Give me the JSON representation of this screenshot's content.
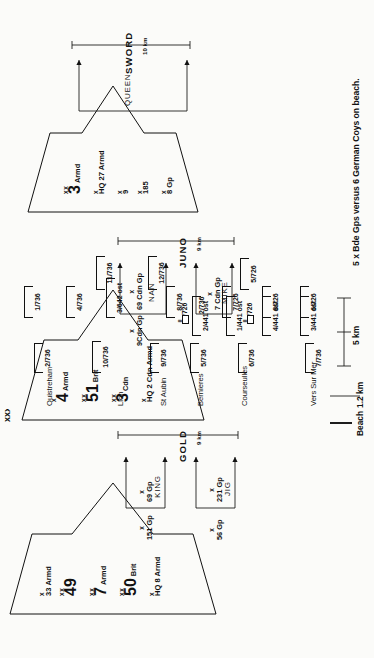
{
  "figure": {
    "caption": "5 x Bde Gps versus 6 German Coys on beach.",
    "scale": {
      "beach_label": "Beach",
      "beach_depth": "1.2 km",
      "distance": "5 km"
    }
  },
  "formations": [
    {
      "id": "gold-force",
      "units": [
        {
          "size": "x",
          "num": "33",
          "suffix": "Armd",
          "small": true
        },
        {
          "size": "xx",
          "num": "49",
          "suffix": "",
          "small": false
        },
        {
          "size": "xx",
          "num": "7",
          "suffix": "Armd",
          "small": false
        },
        {
          "size": "xx",
          "num": "50",
          "suffix": "Brit",
          "small": false
        },
        {
          "size": "x",
          "num": "HQ 8 Armd",
          "suffix": "",
          "small": true
        }
      ]
    },
    {
      "id": "juno-force",
      "units": [
        {
          "size": "x",
          "num": "4",
          "suffix": "Armd",
          "small": false
        },
        {
          "size": "xx",
          "num": "51",
          "suffix": "Brit",
          "small": false
        },
        {
          "size": "xx",
          "num": "3",
          "suffix": "Cdn",
          "small": false
        },
        {
          "size": "x",
          "num": "HQ 2 Cdn Armd",
          "suffix": "",
          "small": true
        }
      ]
    },
    {
      "id": "sword-force",
      "units": [
        {
          "size": "xx",
          "num": "3",
          "suffix": "Armd",
          "small": false
        },
        {
          "size": "x",
          "num": "HQ 27 Armd",
          "suffix": "",
          "small": true
        },
        {
          "size": "x",
          "num": "9",
          "suffix": "",
          "small": true
        },
        {
          "size": "x",
          "num": "185",
          "suffix": "",
          "small": true
        },
        {
          "size": "x",
          "num": "8 Gp",
          "suffix": "",
          "small": true
        }
      ]
    }
  ],
  "brigades": [
    {
      "size": "x",
      "name": "56 Gp"
    },
    {
      "size": "x",
      "name": "151 Gp"
    },
    {
      "size": "x",
      "name": "231 Gp"
    },
    {
      "size": "x",
      "name": "69 Gp"
    },
    {
      "size": "x",
      "name": "7 Cdn Gp"
    },
    {
      "size": "x",
      "name": "9Cdn Gp"
    },
    {
      "size": "x",
      "name": "69 Cdn Gp"
    }
  ],
  "beaches": [
    {
      "name": "GOLD",
      "width": "9 km",
      "sectors": [
        "JIG",
        "KING"
      ]
    },
    {
      "name": "JUNO",
      "width": "9 km",
      "sectors": [
        "MIKE",
        "NAN"
      ]
    },
    {
      "name": "SWORD",
      "width": "10 km",
      "sectors": [
        "QUEEN"
      ]
    }
  ],
  "towns": [
    "Vers Sur Mer",
    "Courseulles",
    "Bernieres",
    "St Aubin",
    "Lion",
    "Ouistreham"
  ],
  "german_units": {
    "front_line": [
      "7/736",
      "3/441 ost",
      "4/441 ost",
      "1/441 ost",
      "6/736",
      "2/441 ost",
      "5/736",
      "9/736",
      "10/736",
      "2/736"
    ],
    "second_line": [
      "6/726",
      "8/726",
      "5/726",
      "7/726",
      "2/736",
      "8/736",
      "12/736",
      "3/642 ost",
      "11/736",
      "4/736",
      "1/736"
    ],
    "battalion_symbols": [
      {
        "echelon": "II",
        "name": "/726"
      },
      {
        "echelon": "II",
        "name": "/726"
      }
    ]
  }
}
